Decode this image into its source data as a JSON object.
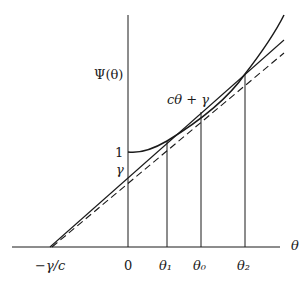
{
  "diagram": {
    "y_axis_label": "Ψ(θ)",
    "x_axis_label": "θ",
    "line_label": "cθ + γ",
    "y_ticks": [
      {
        "label": "1"
      },
      {
        "label": "γ"
      }
    ],
    "x_ticks": [
      {
        "label": "−γ/c"
      },
      {
        "label": "0"
      },
      {
        "label": "θ₁"
      },
      {
        "label": "θ₀"
      },
      {
        "label": "θ₂"
      }
    ],
    "elements": {
      "curve": "Ψ(θ) convex curve starting at 1 on vertical axis",
      "solid_line": "cθ + γ intersecting curve at θ₁ and θ₂",
      "dashed_line": "parallel tangent line below solid line",
      "vertical_lines": [
        "θ₁",
        "θ₀",
        "θ₂"
      ]
    },
    "colors": {
      "ink": "#1a1a1a",
      "background": "#ffffff"
    }
  }
}
